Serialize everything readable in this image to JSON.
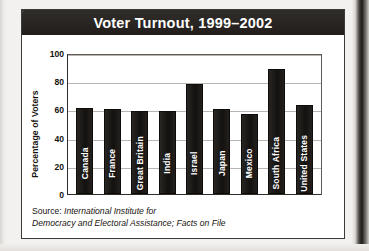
{
  "chart_data": {
    "type": "bar",
    "title": "Voter Turnout, 1999–2002",
    "xlabel": "",
    "ylabel": "Percentage of Voters",
    "ylim": [
      0,
      100
    ],
    "yticks": [
      0,
      20,
      40,
      60,
      80,
      100
    ],
    "grid": true,
    "legend": "none",
    "categories": [
      "Canada",
      "France",
      "Great Britain",
      "India",
      "Israel",
      "Japan",
      "Mexico",
      "South Africa",
      "United States"
    ],
    "values": [
      61,
      60,
      59,
      59,
      78,
      60,
      57,
      89,
      63
    ],
    "bar_color": "#201d1a",
    "source": {
      "label": "Source:",
      "body_line_1": "International Institute for",
      "body_line_2": "Democracy and Electoral Assistance; Facts on File"
    }
  },
  "colors": {
    "title_bar": "#2b2724",
    "title_text": "#ffffff",
    "card_background": "#ffffff",
    "card_border": "#3a3a3a",
    "gridline": "#b9b6b1",
    "axis": "#2f2c28",
    "page_background": "#f2f1ef",
    "bar_label_text": "#ffffff"
  }
}
